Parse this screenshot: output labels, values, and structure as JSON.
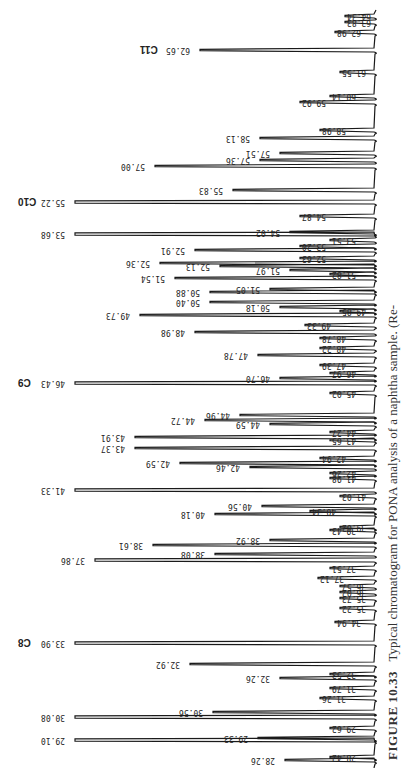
{
  "caption": {
    "figure_label": "FIGURE 10.33",
    "text": "Typical chromatogram for PONA analysis of a naphtha sample. (Re-"
  },
  "chart_data": {
    "type": "line",
    "title": "Typical chromatogram for PONA analysis of a naphtha sample",
    "orientation": "rotated 90°, peaks extend leftward from baseline at right, labels printed upside-down",
    "xlabel": "Retention time (min)",
    "ylabel": "Detector response",
    "x_range": [
      28,
      65
    ],
    "grid": false,
    "legend": null,
    "carbon_markers": [
      {
        "label": "C8",
        "retention_time": 33.9
      },
      {
        "label": "C9",
        "retention_time": 46.43
      },
      {
        "label": "C10",
        "retention_time": 55.22
      },
      {
        "label": "C11",
        "retention_time": 62.65
      }
    ],
    "peaks": [
      {
        "rt": "64.34",
        "y": 16,
        "tip": 345
      },
      {
        "rt": "63.83",
        "y": 22,
        "tip": 345
      },
      {
        "rt": "62.98",
        "y": 32,
        "tip": 335
      },
      {
        "rt": "62.65",
        "y": 50,
        "tip": 200
      },
      {
        "rt": "61.55",
        "y": 72,
        "tip": 340
      },
      {
        "rt": "60.14",
        "y": 96,
        "tip": 330
      },
      {
        "rt": "59.92",
        "y": 102,
        "tip": 300
      },
      {
        "rt": "58.98",
        "y": 130,
        "tip": 320
      },
      {
        "rt": "58.13",
        "y": 138,
        "tip": 260
      },
      {
        "rt": "57.51",
        "y": 153,
        "tip": 280
      },
      {
        "rt": "57.36",
        "y": 160,
        "tip": 260
      },
      {
        "rt": "57.00",
        "y": 166,
        "tip": 155
      },
      {
        "rt": "55.83",
        "y": 190,
        "tip": 233
      },
      {
        "rt": "55.22",
        "y": 202,
        "tip": 75
      },
      {
        "rt": "54.87",
        "y": 216,
        "tip": 300
      },
      {
        "rt": "54.02",
        "y": 232,
        "tip": 290
      },
      {
        "rt": "53.68",
        "y": 234,
        "tip": 75
      },
      {
        "rt": "53.51",
        "y": 240,
        "tip": 330
      },
      {
        "rt": "53.20",
        "y": 246,
        "tip": 300
      },
      {
        "rt": "52.91",
        "y": 250,
        "tip": 195
      },
      {
        "rt": "52.63",
        "y": 258,
        "tip": 300
      },
      {
        "rt": "52.36",
        "y": 263,
        "tip": 160
      },
      {
        "rt": "52.13",
        "y": 266,
        "tip": 220
      },
      {
        "rt": "51.97",
        "y": 270,
        "tip": 290
      },
      {
        "rt": "51.82",
        "y": 274,
        "tip": 330
      },
      {
        "rt": "51.54",
        "y": 278,
        "tip": 175
      },
      {
        "rt": "51.05",
        "y": 289,
        "tip": 270
      },
      {
        "rt": "50.88",
        "y": 292,
        "tip": 210
      },
      {
        "rt": "50.40",
        "y": 302,
        "tip": 210
      },
      {
        "rt": "50.18",
        "y": 307,
        "tip": 280
      },
      {
        "rt": "49.85",
        "y": 311,
        "tip": 340
      },
      {
        "rt": "49.73",
        "y": 315,
        "tip": 140
      },
      {
        "rt": "49.33",
        "y": 325,
        "tip": 305
      },
      {
        "rt": "48.98",
        "y": 332,
        "tip": 195
      },
      {
        "rt": "48.78",
        "y": 338,
        "tip": 320
      },
      {
        "rt": "48.22",
        "y": 348,
        "tip": 320
      },
      {
        "rt": "47.78",
        "y": 355,
        "tip": 258
      },
      {
        "rt": "47.39",
        "y": 365,
        "tip": 320
      },
      {
        "rt": "46.97",
        "y": 373,
        "tip": 330
      },
      {
        "rt": "46.70",
        "y": 378,
        "tip": 280
      },
      {
        "rt": "46.43",
        "y": 383,
        "tip": 75
      },
      {
        "rt": "45.02",
        "y": 393,
        "tip": 330
      },
      {
        "rt": "44.96",
        "y": 415,
        "tip": 240
      },
      {
        "rt": "44.72",
        "y": 420,
        "tip": 205
      },
      {
        "rt": "44.59",
        "y": 424,
        "tip": 270
      },
      {
        "rt": "44.27",
        "y": 432,
        "tip": 330
      },
      {
        "rt": "43.91",
        "y": 437,
        "tip": 135
      },
      {
        "rt": "43.65",
        "y": 440,
        "tip": 330
      },
      {
        "rt": "43.37",
        "y": 448,
        "tip": 135
      },
      {
        "rt": "42.94",
        "y": 458,
        "tip": 320
      },
      {
        "rt": "42.59",
        "y": 463,
        "tip": 180
      },
      {
        "rt": "42.46",
        "y": 467,
        "tip": 250
      },
      {
        "rt": "42.26",
        "y": 473,
        "tip": 330
      },
      {
        "rt": "41.98",
        "y": 478,
        "tip": 330
      },
      {
        "rt": "41.33",
        "y": 490,
        "tip": 75
      },
      {
        "rt": "41.03",
        "y": 496,
        "tip": 340
      },
      {
        "rt": "40.56",
        "y": 506,
        "tip": 262
      },
      {
        "rt": "40.34",
        "y": 511,
        "tip": 310
      },
      {
        "rt": "40.18",
        "y": 514,
        "tip": 215
      },
      {
        "rt": "39.62",
        "y": 527,
        "tip": 340
      },
      {
        "rt": "39.43",
        "y": 530,
        "tip": 330
      },
      {
        "rt": "38.92",
        "y": 540,
        "tip": 270
      },
      {
        "rt": "38.61",
        "y": 545,
        "tip": 153
      },
      {
        "rt": "38.08",
        "y": 554,
        "tip": 215
      },
      {
        "rt": "37.86",
        "y": 560,
        "tip": 95
      },
      {
        "rt": "37.51",
        "y": 568,
        "tip": 330
      },
      {
        "rt": "37.12",
        "y": 578,
        "tip": 318
      },
      {
        "rt": "36.57",
        "y": 586,
        "tip": 340
      },
      {
        "rt": "36.02",
        "y": 592,
        "tip": 340
      },
      {
        "rt": "35.73",
        "y": 598,
        "tip": 340
      },
      {
        "rt": "35.22",
        "y": 608,
        "tip": 340
      },
      {
        "rt": "34.94",
        "y": 622,
        "tip": 335
      },
      {
        "rt": "33.90",
        "y": 643,
        "tip": 75
      },
      {
        "rt": "32.92",
        "y": 664,
        "tip": 190
      },
      {
        "rt": "32.53",
        "y": 674,
        "tip": 330
      },
      {
        "rt": "32.26",
        "y": 678,
        "tip": 280
      },
      {
        "rt": "31.79",
        "y": 688,
        "tip": 330
      },
      {
        "rt": "31.26",
        "y": 698,
        "tip": 320
      },
      {
        "rt": "30.56",
        "y": 712,
        "tip": 213
      },
      {
        "rt": "30.08",
        "y": 717,
        "tip": 75
      },
      {
        "rt": "29.62",
        "y": 728,
        "tip": 330
      },
      {
        "rt": "29.33",
        "y": 738,
        "tip": 258
      },
      {
        "rt": "29.10",
        "y": 740,
        "tip": 75
      },
      {
        "rt": "28.42",
        "y": 757,
        "tip": 330
      },
      {
        "rt": "28.26",
        "y": 760,
        "tip": 285
      }
    ]
  },
  "colors": {
    "ink": "#1a1a1a",
    "paper": "#ffffff",
    "caption": "#333333"
  }
}
